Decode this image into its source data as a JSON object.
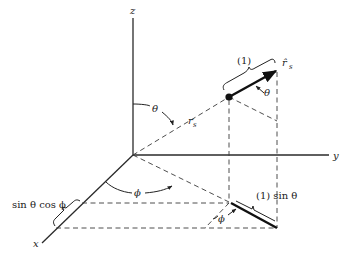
{
  "figure": {
    "axes": {
      "z": "z",
      "y": "y",
      "x": "x"
    },
    "labels": {
      "theta_top": "θ",
      "r_s": "r",
      "r_s_sub": "s",
      "theta_arrow": "θ",
      "phi_bottom": "ϕ",
      "phi_small": "ϕ",
      "unit_one": "(1)",
      "r_hat": "r̂",
      "r_hat_sub": "s",
      "sin_theta": "(1) sin θ",
      "sin_cos": "sin θ cos ϕ"
    },
    "colors": {
      "ink": "#222222",
      "background": "#ffffff"
    }
  }
}
